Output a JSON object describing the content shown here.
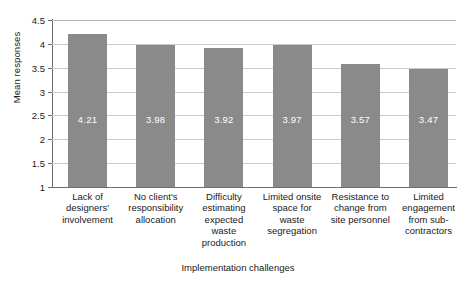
{
  "chart_data": {
    "type": "bar",
    "title": "",
    "xlabel": "Implementation challenges",
    "ylabel": "Mean responses",
    "ylim": [
      1,
      4.5
    ],
    "yticks": [
      "1",
      "1.5",
      "2",
      "2.5",
      "3",
      "3.5",
      "4",
      "4.5"
    ],
    "ytick_values": [
      1,
      1.5,
      2,
      2.5,
      3,
      3.5,
      4,
      4.5
    ],
    "grid": true,
    "legend": "none",
    "bar_color": "#8a8a8a",
    "value_label_color": "#ffffff",
    "categories": [
      "Lack of designers' involvement",
      "No client's responsibility allocation",
      "Difficulty estimating expected waste production",
      "Limited onsite space for waste segregation",
      "Resistance to change from site personnel",
      "Limited engagement from sub-contractors"
    ],
    "values": [
      4.21,
      3.98,
      3.92,
      3.97,
      3.57,
      3.47
    ],
    "value_labels": [
      "4.21",
      "3.98",
      "3.92",
      "3.97",
      "3.57",
      "3.47"
    ]
  },
  "caption": "",
  "bars": [
    {
      "label_lines": [
        "Lack of",
        "designers'",
        "involvement"
      ],
      "value": 4.21,
      "value_label": "4.21"
    },
    {
      "label_lines": [
        "No client's",
        "responsibility",
        "allocation"
      ],
      "value": 3.98,
      "value_label": "3.98"
    },
    {
      "label_lines": [
        "Difficulty",
        "estimating",
        "expected",
        "waste",
        "production"
      ],
      "value": 3.92,
      "value_label": "3.92"
    },
    {
      "label_lines": [
        "Limited onsite",
        "space for",
        "waste",
        "segregation"
      ],
      "value": 3.97,
      "value_label": "3.97"
    },
    {
      "label_lines": [
        "Resistance to",
        "change from",
        "site personnel"
      ],
      "value": 3.57,
      "value_label": "3.57"
    },
    {
      "label_lines": [
        "Limited",
        "engagement",
        "from sub-",
        "contractors"
      ],
      "value": 3.47,
      "value_label": "3.47"
    }
  ]
}
